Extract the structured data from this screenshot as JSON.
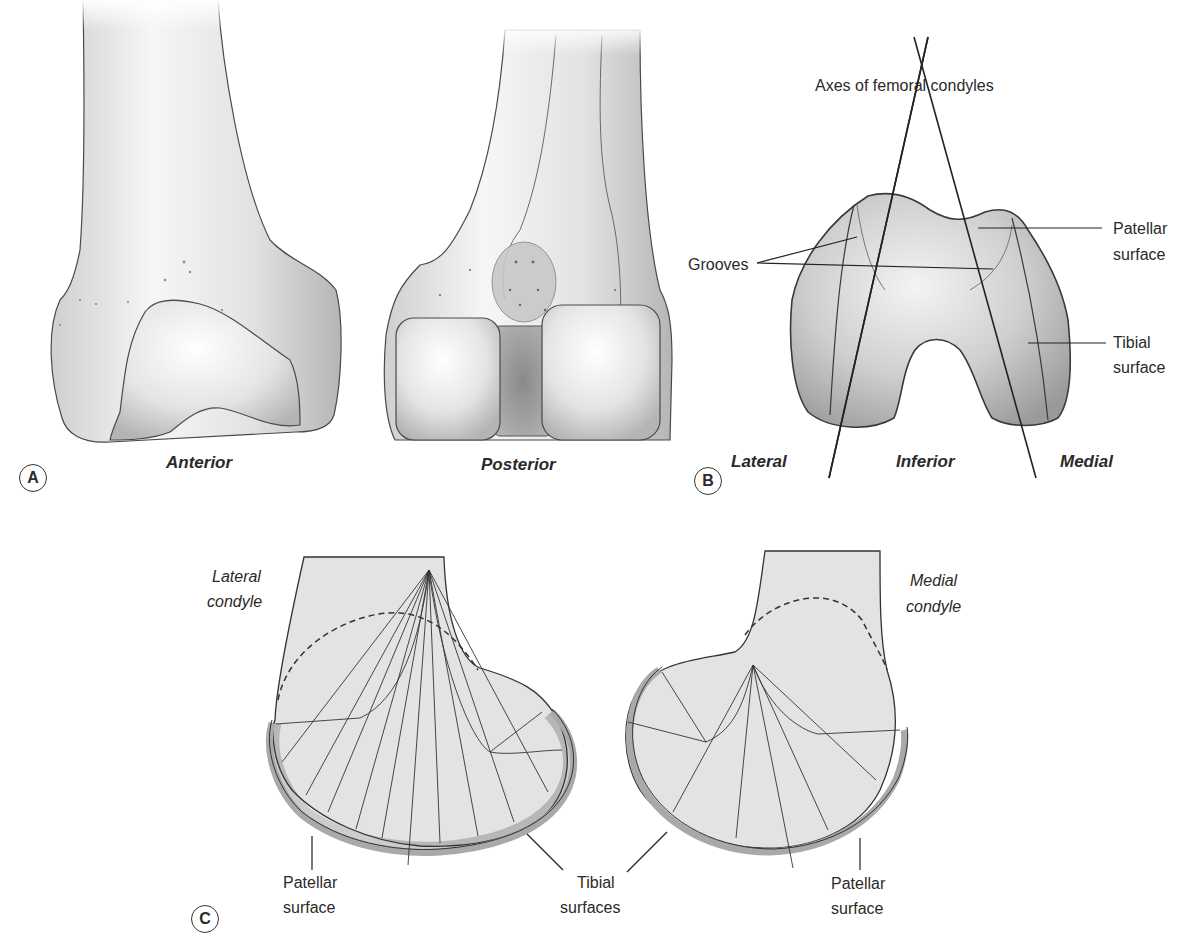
{
  "figure": {
    "panels": [
      {
        "marker": "A",
        "views": [
          "Anterior",
          "Posterior"
        ]
      },
      {
        "marker": "B",
        "title_label": "Axes of femoral condyles",
        "labels": {
          "grooves": "Grooves",
          "patellar_surface": [
            "Patellar",
            "surface"
          ],
          "tibial_surface": [
            "Tibial",
            "surface"
          ]
        },
        "orientation": [
          "Lateral",
          "Inferior",
          "Medial"
        ]
      },
      {
        "marker": "C",
        "condyles": {
          "lateral": [
            "Lateral",
            "condyle"
          ],
          "medial": [
            "Medial",
            "condyle"
          ]
        },
        "labels": {
          "patellar_left": [
            "Patellar",
            "surface"
          ],
          "tibial": [
            "Tibial",
            "surfaces"
          ],
          "patellar_right": [
            "Patellar",
            "surface"
          ]
        }
      }
    ],
    "colors": {
      "bone_light": "#f2f2f2",
      "bone_mid": "#cfcfcf",
      "bone_dark": "#9a9a9a",
      "section_fill": "#e3e3e3",
      "cartilage": "#b9b9b9",
      "outline": "#3a3a3a"
    }
  }
}
